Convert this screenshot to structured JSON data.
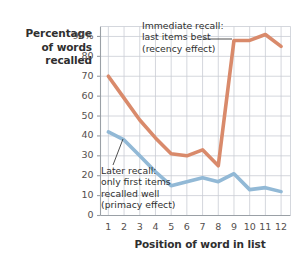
{
  "chart_data": {
    "type": "line",
    "title": "",
    "xlabel": "Position of word in list",
    "ylabel": "Percentage of words recalled",
    "x": [
      1,
      2,
      3,
      4,
      5,
      6,
      7,
      8,
      9,
      10,
      11,
      12
    ],
    "xtick_labels": [
      "1",
      "2",
      "3",
      "4",
      "5",
      "6",
      "7",
      "8",
      "9",
      "10",
      "11",
      "12"
    ],
    "ytick_labels": [
      "0",
      "10",
      "20",
      "30",
      "40",
      "50",
      "60",
      "70",
      "80",
      "90%"
    ],
    "ytick_values": [
      0,
      10,
      20,
      30,
      40,
      50,
      60,
      70,
      80,
      90
    ],
    "ylim": [
      0,
      95
    ],
    "xlim": [
      0.5,
      12.6
    ],
    "grid": true,
    "legend_position": "none",
    "series": [
      {
        "name": "Immediate recall",
        "color": "#d98a6b",
        "values": [
          70,
          59,
          48,
          39,
          31,
          30,
          33,
          25,
          88,
          88,
          91,
          85
        ]
      },
      {
        "name": "Later recall",
        "color": "#92b9d6",
        "values": [
          42,
          38,
          30,
          22,
          15,
          17,
          19,
          17,
          21,
          13,
          14,
          12
        ]
      }
    ],
    "annotations": [
      {
        "name": "recency-annotation",
        "text": "Immediate recall:\nlast items best\n(recency effect)",
        "target_series": "Immediate recall"
      },
      {
        "name": "primacy-annotation",
        "text": "Later recall:\nonly first items\nrecalled well\n(primacy effect)",
        "target_series": "Later recall"
      }
    ]
  },
  "axis": {
    "y_title": "Percentage\nof words\nrecalled",
    "x_title": "Position of word in list"
  },
  "colors": {
    "immediate_recall": "#d98a6b",
    "later_recall": "#92b9d6",
    "grid": "#c9cdd4",
    "axis": "#9aa0a6",
    "text": "#2f2f2f"
  }
}
